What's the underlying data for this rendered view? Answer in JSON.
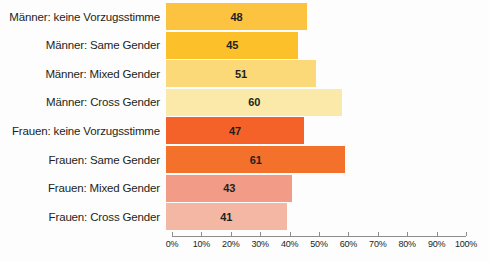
{
  "chart_data": {
    "type": "bar",
    "orientation": "horizontal",
    "title": "",
    "subtitle": "",
    "xlabel": "",
    "ylabel": "",
    "xlim": [
      0,
      100
    ],
    "xtick_suffix": "%",
    "grid": false,
    "legend": false,
    "categories": [
      "Männer: keine Vorzugsstimme",
      "Männer: Same Gender",
      "Männer: Mixed Gender",
      "Männer: Cross Gender",
      "Frauen: keine Vorzugsstimme",
      "Frauen: Same Gender",
      "Frauen: Mixed Gender",
      "Frauen: Cross Gender"
    ],
    "values": [
      48,
      45,
      51,
      60,
      47,
      61,
      43,
      41
    ],
    "value_labels": [
      "48",
      "45",
      "51",
      "60",
      "47",
      "61",
      "43",
      "41"
    ],
    "colors": [
      "#fbc340",
      "#fbc02a",
      "#fbd978",
      "#fae9a8",
      "#f4622a",
      "#f4712c",
      "#f29b87",
      "#f4b7a4"
    ],
    "tick_values": [
      0,
      10,
      20,
      30,
      40,
      50,
      60,
      70,
      80,
      90,
      100
    ],
    "tick_labels": [
      "0%",
      "10%",
      "20%",
      "30%",
      "40%",
      "50%",
      "60%",
      "70%",
      "80%",
      "90%",
      "100%"
    ],
    "axis_color": "#8d8d8d",
    "text_color": "#231f20",
    "background": "#fdfdfd"
  }
}
